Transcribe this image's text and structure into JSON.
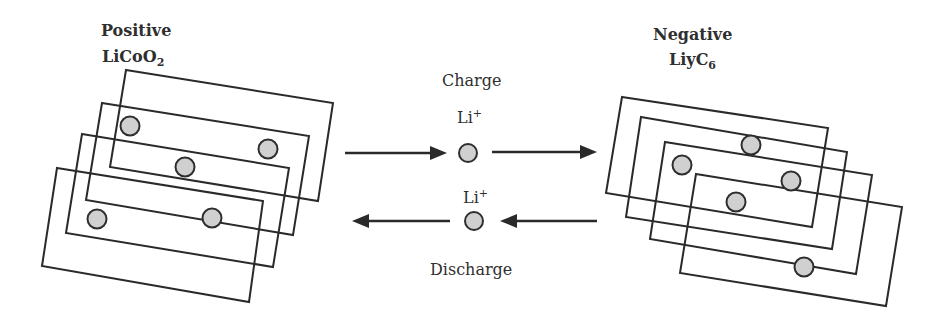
{
  "colors": {
    "line": "#2a2a2a",
    "ion_fill": "#d0d0d0",
    "ion_stroke": "#2e2e2e",
    "text": "#2f2f2f",
    "background": "#ffffff"
  },
  "positive_electrode": {
    "title": "Positive",
    "formula_main": "LiCoO",
    "formula_sub": "2",
    "plates": [
      {
        "points": "126,70 333,103 318,201 110,167"
      },
      {
        "points": "102,103 309,136 293,235 86,200"
      },
      {
        "points": "82,134 289,168 273,267 66,233"
      },
      {
        "points": "57,168 263,201 249,302 42,266"
      }
    ],
    "ions": [
      {
        "cx": 130,
        "cy": 126
      },
      {
        "cx": 268,
        "cy": 149
      },
      {
        "cx": 185,
        "cy": 167
      },
      {
        "cx": 97,
        "cy": 219
      },
      {
        "cx": 212,
        "cy": 218
      }
    ]
  },
  "negative_electrode": {
    "title": "Negative",
    "formula_main": "LiyC",
    "formula_sub": "6",
    "plates": [
      {
        "points": "622,97 828,128 812,227 606,193"
      },
      {
        "points": "641,117 847,152 832,249 626,217"
      },
      {
        "points": "665,142 872,175 856,274 650,239"
      },
      {
        "points": "696,174 902,207 886,306 680,273"
      }
    ],
    "ions": [
      {
        "cx": 751,
        "cy": 145
      },
      {
        "cx": 682,
        "cy": 165
      },
      {
        "cx": 791,
        "cy": 181
      },
      {
        "cx": 736,
        "cy": 202
      },
      {
        "cx": 804,
        "cy": 267
      }
    ]
  },
  "charge": {
    "label": "Charge",
    "ion_label": "Li",
    "ion_charge": "+",
    "ion": {
      "cx": 468,
      "cy": 153
    },
    "arrows": [
      {
        "x1": 345,
        "x2": 447,
        "y": 153,
        "direction": "right"
      },
      {
        "x1": 492,
        "x2": 597,
        "y": 152,
        "direction": "right"
      }
    ]
  },
  "discharge": {
    "label": "Discharge",
    "ion_label": "Li",
    "ion_charge": "+",
    "ion": {
      "cx": 474,
      "cy": 221
    },
    "arrows": [
      {
        "x1": 450,
        "x2": 352,
        "y": 221,
        "direction": "left"
      },
      {
        "x1": 597,
        "x2": 500,
        "y": 221,
        "direction": "left"
      }
    ]
  }
}
